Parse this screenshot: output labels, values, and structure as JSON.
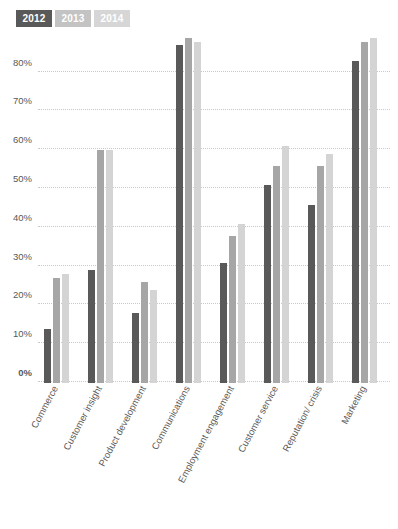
{
  "legend": {
    "position": "top-left",
    "entries": [
      {
        "label": "2012",
        "color": "#595959",
        "chip_text_color": "#ffffff"
      },
      {
        "label": "2013",
        "color": "#c3c3c3",
        "chip_text_color": "#ffffff"
      },
      {
        "label": "2014",
        "color": "#d6d6d6",
        "chip_text_color": "#ffffff"
      }
    ]
  },
  "axis": {
    "y_ticks": [
      "0%",
      "10%",
      "20%",
      "30%",
      "40%",
      "50%",
      "60%",
      "70%",
      "80%"
    ]
  },
  "chart_data": {
    "type": "bar",
    "title": "",
    "xlabel": "",
    "ylabel": "",
    "ylim": [
      0,
      92
    ],
    "grid": true,
    "legend_position": "top-left",
    "categories": [
      "Commerce",
      "Customer insight",
      "Product development",
      "Communications",
      "Employment engagement",
      "Customer service",
      "Reputation/ crisis",
      "Marketing"
    ],
    "tick_labels": [
      "0%",
      "10%",
      "20%",
      "30%",
      "40%",
      "50%",
      "60%",
      "70%",
      "80%"
    ],
    "tick_values": [
      0,
      10,
      20,
      30,
      40,
      50,
      60,
      70,
      80
    ],
    "series": [
      {
        "name": "2012",
        "color": "#595959",
        "values": [
          14,
          29,
          18,
          87,
          31,
          51,
          46,
          83
        ]
      },
      {
        "name": "2013",
        "color": "#a6a6a6",
        "values": [
          27,
          60,
          26,
          89,
          38,
          56,
          56,
          88
        ]
      },
      {
        "name": "2014",
        "color": "#d4d4d4",
        "values": [
          28,
          60,
          24,
          88,
          41,
          61,
          59,
          89
        ]
      }
    ]
  }
}
